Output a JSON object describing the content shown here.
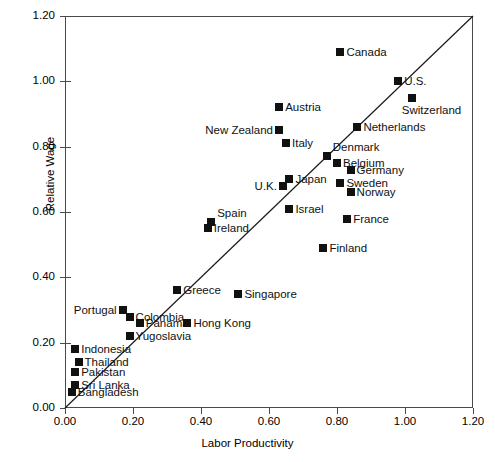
{
  "chart_data": {
    "type": "scatter",
    "title": "",
    "xlabel": "Labor Productivity",
    "ylabel": "Relative Wage",
    "xlim": [
      0.0,
      1.2
    ],
    "ylim": [
      0.0,
      1.2
    ],
    "xticks": [
      "0.00",
      "0.20",
      "0.40",
      "0.60",
      "0.80",
      "1.00",
      "1.20"
    ],
    "yticks": [
      "0.00",
      "0.20",
      "0.40",
      "0.60",
      "0.80",
      "1.00",
      "1.20"
    ],
    "grid": false,
    "legend": "none",
    "reference_line": {
      "description": "45-degree line y = x",
      "x": [
        0.0,
        1.2
      ],
      "y": [
        0.0,
        1.2
      ]
    },
    "points": [
      {
        "name": "Canada",
        "x": 0.81,
        "y": 1.09,
        "label_side": "right"
      },
      {
        "name": "U.S.",
        "x": 0.98,
        "y": 1.0,
        "label_side": "right"
      },
      {
        "name": "Switzerland",
        "x": 1.02,
        "y": 0.95,
        "label_side": "below-right"
      },
      {
        "name": "Austria",
        "x": 0.63,
        "y": 0.92,
        "label_side": "right"
      },
      {
        "name": "New Zealand",
        "x": 0.63,
        "y": 0.85,
        "label_side": "left"
      },
      {
        "name": "Netherlands",
        "x": 0.86,
        "y": 0.86,
        "label_side": "right"
      },
      {
        "name": "Italy",
        "x": 0.65,
        "y": 0.81,
        "label_side": "right"
      },
      {
        "name": "Denmark",
        "x": 0.77,
        "y": 0.77,
        "label_side": "above-right"
      },
      {
        "name": "Belgium",
        "x": 0.8,
        "y": 0.75,
        "label_side": "right"
      },
      {
        "name": "Germany",
        "x": 0.84,
        "y": 0.73,
        "label_side": "right"
      },
      {
        "name": "Japan",
        "x": 0.66,
        "y": 0.7,
        "label_side": "right"
      },
      {
        "name": "U.K.",
        "x": 0.64,
        "y": 0.68,
        "label_side": "left"
      },
      {
        "name": "Sweden",
        "x": 0.81,
        "y": 0.69,
        "label_side": "right"
      },
      {
        "name": "Norway",
        "x": 0.84,
        "y": 0.66,
        "label_side": "right"
      },
      {
        "name": "Israel",
        "x": 0.66,
        "y": 0.61,
        "label_side": "right"
      },
      {
        "name": "France",
        "x": 0.83,
        "y": 0.58,
        "label_side": "right"
      },
      {
        "name": "Spain",
        "x": 0.43,
        "y": 0.57,
        "label_side": "above-right"
      },
      {
        "name": "Ireland",
        "x": 0.42,
        "y": 0.55,
        "label_side": "right"
      },
      {
        "name": "Finland",
        "x": 0.76,
        "y": 0.49,
        "label_side": "right"
      },
      {
        "name": "Greece",
        "x": 0.33,
        "y": 0.36,
        "label_side": "right"
      },
      {
        "name": "Singapore",
        "x": 0.51,
        "y": 0.35,
        "label_side": "right"
      },
      {
        "name": "Portugal",
        "x": 0.17,
        "y": 0.3,
        "label_side": "left"
      },
      {
        "name": "Colombia",
        "x": 0.19,
        "y": 0.28,
        "label_side": "right"
      },
      {
        "name": "Panama",
        "x": 0.22,
        "y": 0.26,
        "label_side": "right"
      },
      {
        "name": "Hong Kong",
        "x": 0.36,
        "y": 0.26,
        "label_side": "right"
      },
      {
        "name": "Yugoslavia",
        "x": 0.19,
        "y": 0.22,
        "label_side": "right"
      },
      {
        "name": "Indonesia",
        "x": 0.03,
        "y": 0.18,
        "label_side": "right"
      },
      {
        "name": "Thailand",
        "x": 0.04,
        "y": 0.14,
        "label_side": "right"
      },
      {
        "name": "Pakistan",
        "x": 0.03,
        "y": 0.11,
        "label_side": "right"
      },
      {
        "name": "Sri Lanka",
        "x": 0.03,
        "y": 0.07,
        "label_side": "right"
      },
      {
        "name": "Bangladesh",
        "x": 0.02,
        "y": 0.05,
        "label_side": "right"
      }
    ]
  },
  "colors": {
    "marker": "#111111",
    "axis": "#4a4a4a",
    "text": "#000000",
    "background": "#ffffff"
  }
}
